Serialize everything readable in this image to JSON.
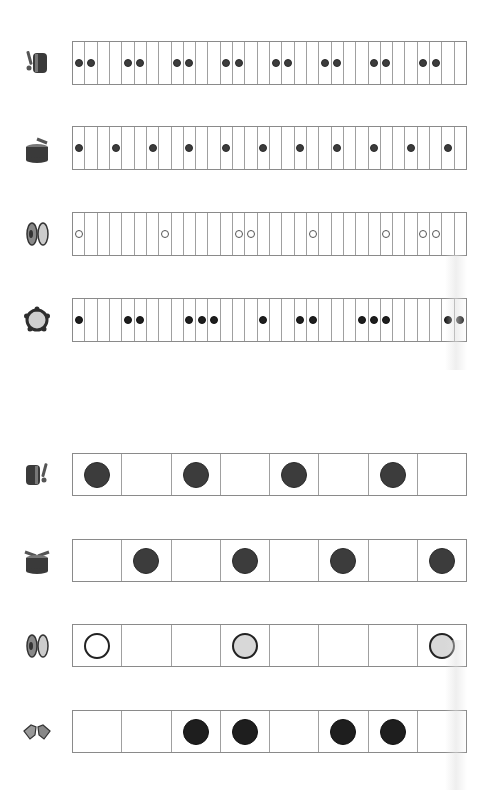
{
  "colors": {
    "grid_line": "#a0a0a0",
    "filled_dot": "#3c3c3c",
    "black_dot": "#1e1e1e",
    "hollow_dot": "#ffffff",
    "gray_dot": "#d8d8d8",
    "background": "#ffffff"
  },
  "sections": [
    {
      "name": "rhythm-grid-32",
      "cells_per_row": 32,
      "rows": [
        {
          "instrument": "bass-drum",
          "icon": "bass-drum-icon",
          "dot_style": "filled",
          "active_cells": [
            1,
            2,
            5,
            6,
            9,
            10,
            13,
            14,
            17,
            18,
            21,
            22,
            25,
            26,
            29,
            30
          ]
        },
        {
          "instrument": "snare-drum",
          "icon": "snare-drum-icon",
          "dot_style": "filled",
          "active_cells": [
            1,
            4,
            7,
            10,
            13,
            16,
            19,
            22,
            25,
            28,
            31
          ]
        },
        {
          "instrument": "cymbals",
          "icon": "cymbals-icon",
          "dot_style": "hollow",
          "active_cells": [
            1,
            8,
            14,
            15,
            20,
            26,
            29,
            30
          ]
        },
        {
          "instrument": "tambourine",
          "icon": "tambourine-icon",
          "dot_style": "black",
          "active_cells": [
            1,
            5,
            6,
            10,
            11,
            12,
            16,
            19,
            20,
            24,
            25,
            26,
            31,
            32
          ]
        }
      ]
    },
    {
      "name": "rhythm-grid-8",
      "cells_per_row": 8,
      "rows": [
        {
          "instrument": "bass-drum",
          "icon": "bass-drum-icon",
          "cells": [
            "filled",
            "",
            "filled",
            "",
            "filled",
            "",
            "filled",
            ""
          ]
        },
        {
          "instrument": "snare-drum",
          "icon": "snare-drum-icon",
          "cells": [
            "",
            "filled",
            "",
            "filled",
            "",
            "filled",
            "",
            "filled"
          ]
        },
        {
          "instrument": "cymbals",
          "icon": "cymbals-icon",
          "cells": [
            "hollow",
            "",
            "",
            "gray",
            "",
            "",
            "",
            "gray"
          ]
        },
        {
          "instrument": "hand-clap",
          "icon": "hand-clap-icon",
          "cells": [
            "",
            "",
            "black",
            "black",
            "",
            "black",
            "black",
            ""
          ]
        }
      ]
    }
  ]
}
